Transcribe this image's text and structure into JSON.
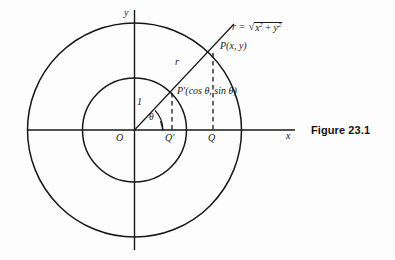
{
  "figure": {
    "caption": "Figure 23.1",
    "background_color": "#fdfdfd",
    "ink_color": "#171717"
  },
  "axes": {
    "x_label": "x",
    "y_label": "y",
    "origin_label": "O",
    "x_axis": {
      "x1": 28,
      "y1": 130,
      "x2": 295,
      "y2": 130
    },
    "y_axis": {
      "x1": 134,
      "y1": 10,
      "x2": 134,
      "y2": 250
    }
  },
  "circles": [
    {
      "name": "unit-circle",
      "center_x": 134.5,
      "center_y": 130,
      "radius": 52,
      "radius_label": "1"
    },
    {
      "name": "outer-circle",
      "center_x": 134.5,
      "center_y": 130,
      "radius": 107,
      "radius_label": "r"
    }
  ],
  "ray": {
    "from_x": 134.5,
    "from_y": 130,
    "to_x": 234,
    "to_y": 24,
    "angle_label": "θ"
  },
  "points": [
    {
      "name": "P",
      "label": "P(x, y)",
      "x": 213,
      "y": 53
    },
    {
      "name": "P-prime",
      "label": "P′(cos θ, sin θ)",
      "x": 172,
      "y": 93
    },
    {
      "name": "Q",
      "label": "Q",
      "x": 213,
      "y": 130
    },
    {
      "name": "Q-prime",
      "label": "Q′",
      "x": 172,
      "y": 130
    }
  ],
  "labels": {
    "radius_unit": "1",
    "radius_r": "r",
    "theta": "θ",
    "formula_lhs": "r =",
    "formula_radicand_x": "x",
    "formula_radicand_plus": "+",
    "formula_radicand_y": "y",
    "formula_exponent": "2"
  },
  "dashed_segments": [
    {
      "name": "P-to-Q",
      "x": 213,
      "y1": 53,
      "y2": 130
    },
    {
      "name": "Pprime-to-Qprime",
      "x": 172,
      "y1": 93,
      "y2": 130
    }
  ]
}
